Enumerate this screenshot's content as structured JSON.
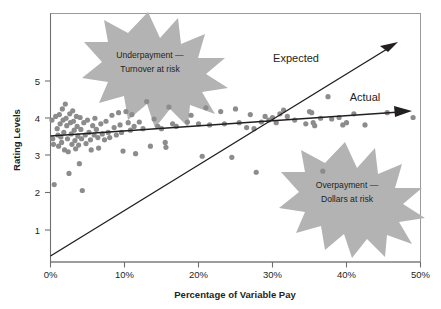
{
  "chart_data": {
    "type": "scatter",
    "title": "",
    "xlabel": "Percentage of Variable Pay",
    "ylabel": "Rating Levels",
    "xlim": [
      0,
      50
    ],
    "ylim": [
      0,
      5.8
    ],
    "grid": false,
    "legend": "none",
    "x_ticks": [
      "0%",
      "10%",
      "20%",
      "30%",
      "40%",
      "50%"
    ],
    "x_tick_values": [
      0,
      10,
      20,
      30,
      40,
      50
    ],
    "y_ticks": [
      "1",
      "2",
      "3",
      "4",
      "5"
    ],
    "y_tick_values": [
      1,
      2,
      3,
      4,
      5
    ],
    "series": [
      {
        "name": "Employees",
        "type": "scatter",
        "color": "#8c8c8c",
        "points": [
          [
            0.2,
            3.95
          ],
          [
            0.3,
            3.45
          ],
          [
            0.4,
            3.3
          ],
          [
            0.5,
            2.22
          ],
          [
            0.7,
            4.05
          ],
          [
            0.9,
            3.72
          ],
          [
            1.0,
            3.55
          ],
          [
            1.1,
            3.25
          ],
          [
            1.2,
            4.1
          ],
          [
            1.3,
            3.85
          ],
          [
            1.4,
            3.5
          ],
          [
            1.5,
            3.35
          ],
          [
            1.6,
            4.25
          ],
          [
            1.7,
            3.95
          ],
          [
            1.8,
            3.62
          ],
          [
            1.9,
            3.15
          ],
          [
            2.0,
            4.38
          ],
          [
            2.1,
            4.0
          ],
          [
            2.2,
            3.8
          ],
          [
            2.3,
            3.45
          ],
          [
            2.4,
            3.1
          ],
          [
            2.5,
            2.52
          ],
          [
            2.6,
            4.12
          ],
          [
            2.7,
            3.88
          ],
          [
            2.8,
            3.58
          ],
          [
            2.9,
            3.3
          ],
          [
            3.0,
            4.2
          ],
          [
            3.1,
            3.92
          ],
          [
            3.2,
            3.68
          ],
          [
            3.3,
            3.4
          ],
          [
            3.4,
            3.18
          ],
          [
            3.5,
            4.05
          ],
          [
            3.6,
            3.78
          ],
          [
            3.7,
            3.52
          ],
          [
            3.8,
            3.28
          ],
          [
            3.9,
            2.78
          ],
          [
            4.0,
            4.02
          ],
          [
            4.1,
            3.7
          ],
          [
            4.2,
            3.45
          ],
          [
            4.3,
            2.06
          ],
          [
            4.5,
            3.88
          ],
          [
            4.7,
            3.55
          ],
          [
            4.8,
            3.32
          ],
          [
            5.0,
            3.95
          ],
          [
            5.2,
            3.62
          ],
          [
            5.4,
            3.42
          ],
          [
            5.5,
            3.15
          ],
          [
            5.7,
            3.8
          ],
          [
            5.9,
            3.55
          ],
          [
            6.0,
            4.0
          ],
          [
            6.2,
            3.7
          ],
          [
            6.4,
            3.48
          ],
          [
            6.5,
            3.2
          ],
          [
            6.8,
            3.85
          ],
          [
            7.0,
            3.58
          ],
          [
            7.3,
            3.42
          ],
          [
            7.5,
            3.92
          ],
          [
            7.8,
            3.62
          ],
          [
            8.0,
            3.48
          ],
          [
            8.3,
            4.08
          ],
          [
            8.6,
            3.75
          ],
          [
            8.9,
            3.55
          ],
          [
            9.2,
            4.15
          ],
          [
            9.4,
            3.82
          ],
          [
            9.6,
            3.62
          ],
          [
            9.8,
            3.12
          ],
          [
            10.2,
            4.18
          ],
          [
            10.5,
            3.88
          ],
          [
            10.8,
            3.68
          ],
          [
            11.0,
            4.1
          ],
          [
            11.3,
            3.78
          ],
          [
            11.5,
            3.05
          ],
          [
            12.0,
            3.9
          ],
          [
            12.5,
            3.72
          ],
          [
            13.0,
            4.45
          ],
          [
            13.5,
            3.25
          ],
          [
            14.0,
            3.98
          ],
          [
            14.5,
            3.78
          ],
          [
            15.0,
            3.72
          ],
          [
            15.5,
            3.35
          ],
          [
            15.6,
            3.22
          ],
          [
            16.0,
            4.3
          ],
          [
            16.5,
            3.85
          ],
          [
            17.0,
            3.78
          ],
          [
            18.5,
            3.9
          ],
          [
            19.0,
            4.08
          ],
          [
            20.0,
            3.85
          ],
          [
            20.5,
            2.98
          ],
          [
            21.0,
            4.28
          ],
          [
            21.5,
            3.82
          ],
          [
            23.0,
            4.18
          ],
          [
            23.5,
            3.85
          ],
          [
            24.5,
            2.95
          ],
          [
            25.0,
            4.25
          ],
          [
            25.5,
            3.88
          ],
          [
            26.5,
            3.75
          ],
          [
            27.0,
            4.1
          ],
          [
            27.5,
            3.72
          ],
          [
            27.8,
            2.55
          ],
          [
            28.5,
            3.9
          ],
          [
            29.0,
            4.05
          ],
          [
            29.5,
            3.95
          ],
          [
            30.0,
            4.02
          ],
          [
            30.5,
            3.88
          ],
          [
            31.0,
            4.12
          ],
          [
            31.5,
            4.22
          ],
          [
            32.0,
            4.05
          ],
          [
            33.0,
            3.95
          ],
          [
            34.5,
            3.85
          ],
          [
            35.0,
            4.18
          ],
          [
            35.3,
            4.15
          ],
          [
            35.5,
            3.88
          ],
          [
            35.7,
            3.8
          ],
          [
            36.5,
            4.0
          ],
          [
            36.8,
            2.58
          ],
          [
            37.5,
            4.58
          ],
          [
            38.0,
            3.98
          ],
          [
            39.0,
            4.02
          ],
          [
            39.5,
            3.82
          ],
          [
            40.0,
            3.88
          ],
          [
            41.0,
            4.12
          ],
          [
            42.5,
            3.82
          ],
          [
            45.5,
            4.15
          ],
          [
            49.0,
            4.02
          ]
        ]
      },
      {
        "name": "Expected",
        "type": "line",
        "color": "#231f20",
        "arrow": true,
        "x_start": 0,
        "y_start": 0.15,
        "x_end": 46.5,
        "y_end": 5.95,
        "label": "Expected"
      },
      {
        "name": "Actual",
        "type": "line",
        "color": "#231f20",
        "arrow": true,
        "x_start": 0,
        "y_start": 3.48,
        "x_end": 48.0,
        "y_end": 4.14,
        "label": "Actual"
      }
    ],
    "annotations": [
      {
        "name": "underpayment-burst",
        "line1": "Underpayment —",
        "line2": "Turnover at risk",
        "shape": "starburst",
        "fill": "#b3b3b3",
        "cx": 148,
        "cy": 67
      },
      {
        "name": "overpayment-burst",
        "line1": "Overpayment —",
        "line2": "Dollars at risk",
        "shape": "starburst",
        "fill": "#b3b3b3",
        "cx": 345,
        "cy": 197
      }
    ],
    "colors": {
      "dot": "#8c8c8c",
      "line": "#231f20",
      "burst": "#b3b3b3",
      "axis": "#6f6f6f",
      "frame": "#9a9a9a",
      "background": "#ffffff"
    }
  }
}
